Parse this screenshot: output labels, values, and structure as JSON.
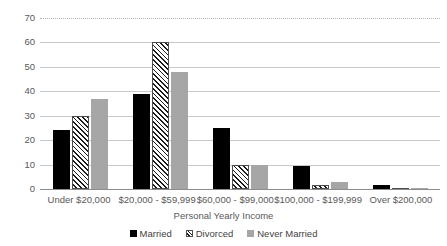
{
  "chart_data": {
    "type": "bar",
    "title": "",
    "subtitle": "",
    "xlabel": "Personal Yearly Income",
    "ylabel": "",
    "ylim": [
      0,
      70
    ],
    "ytick_step": 10,
    "yticks": [
      "0",
      "10",
      "20",
      "30",
      "40",
      "50",
      "60",
      "70"
    ],
    "grid": "horizontal",
    "legend_position": "bottom-center",
    "categories": [
      "Under $20,000",
      "$20,000 - $59,999",
      "$60,000 - $99,000",
      "$100,000 - $199,999",
      "Over $200,000"
    ],
    "series": [
      {
        "name": "Married",
        "fill": "solid-black",
        "color": "#000000",
        "values": [
          24,
          39,
          25,
          9.5,
          1.5
        ]
      },
      {
        "name": "Divorced",
        "fill": "diagonal-hatch",
        "color": "#ffffff",
        "values": [
          30,
          60,
          10,
          1.5,
          0.3
        ]
      },
      {
        "name": "Never Married",
        "fill": "solid-gray",
        "color": "#a6a6a6",
        "values": [
          37,
          48,
          10,
          3,
          0.3
        ]
      }
    ]
  },
  "colors": {
    "gridline": "#c8c8c8",
    "axis": "#8c8c8c",
    "text": "#595959",
    "background": "#ffffff"
  }
}
